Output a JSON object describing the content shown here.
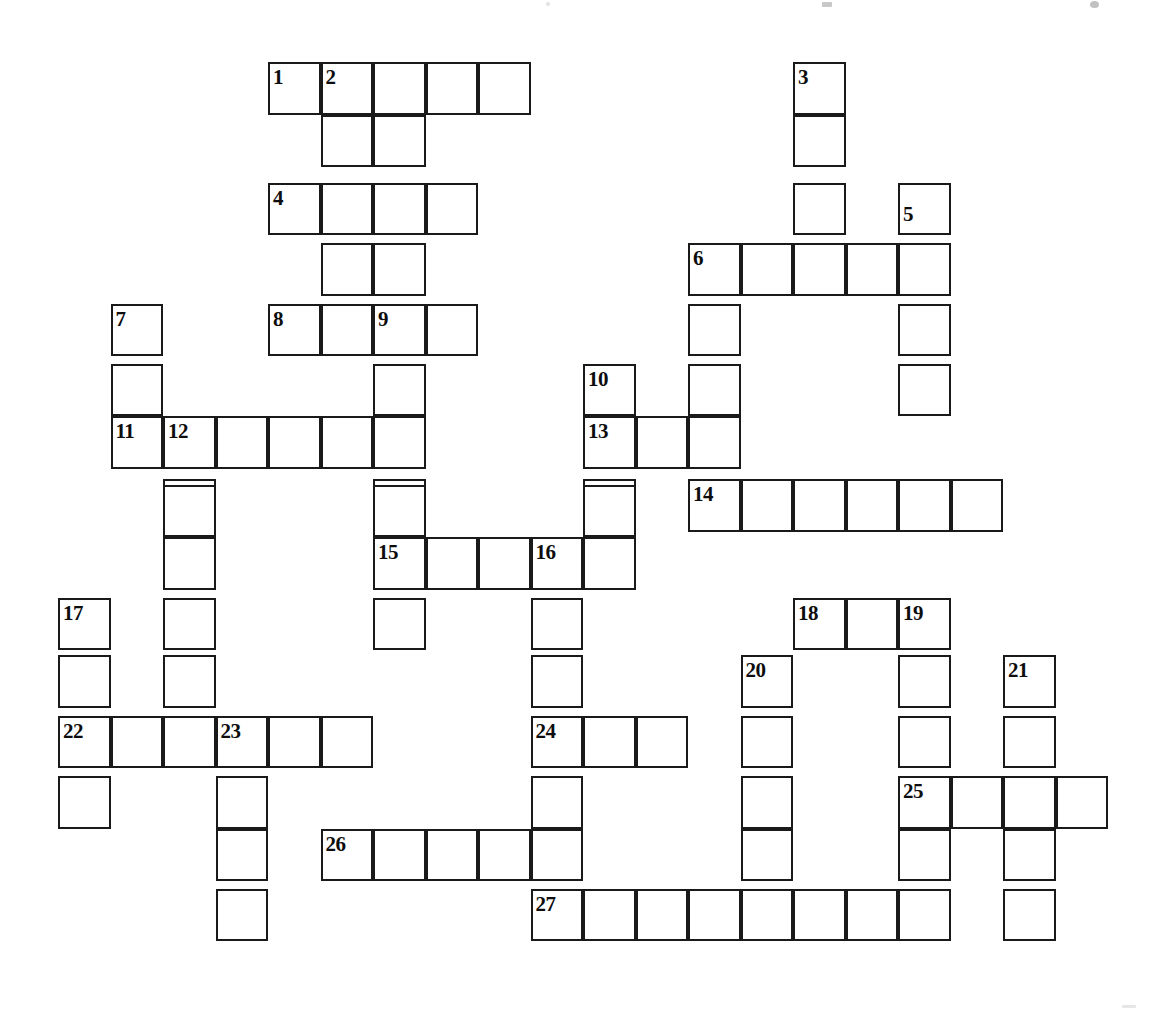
{
  "puzzle": {
    "title": "Crossword Puzzle Grid",
    "kind": "blank-crossword-grid",
    "canvas": {
      "width": 1166,
      "height": 1022,
      "background": "#ffffff"
    },
    "geometry": {
      "cell_size": 52.5,
      "origin_x": 58,
      "origin_y": 62,
      "line_color": "#1a1a1a",
      "line_width": 2.5,
      "number_font_size": 21
    },
    "counts": {
      "numbered_clues": 27,
      "total_cells": 131
    },
    "numbers": [
      {
        "n": "1",
        "col": 4,
        "row": 0
      },
      {
        "n": "2",
        "col": 5,
        "row": 0
      },
      {
        "n": "3",
        "col": 14,
        "row": 0
      },
      {
        "n": "4",
        "col": 4,
        "row": 2.3
      },
      {
        "n": "5",
        "col": 16,
        "row": 2.6
      },
      {
        "n": "6",
        "col": 12,
        "row": 3.45
      },
      {
        "n": "7",
        "col": 1,
        "row": 4.6
      },
      {
        "n": "8",
        "col": 4,
        "row": 4.6
      },
      {
        "n": "9",
        "col": 6,
        "row": 4.6
      },
      {
        "n": "10",
        "col": 10,
        "row": 5.75
      },
      {
        "n": "11",
        "col": 1,
        "row": 6.75
      },
      {
        "n": "12",
        "col": 2,
        "row": 6.75
      },
      {
        "n": "13",
        "col": 10,
        "row": 6.75
      },
      {
        "n": "14",
        "col": 12,
        "row": 7.95
      },
      {
        "n": "15",
        "col": 6,
        "row": 9.05
      },
      {
        "n": "16",
        "col": 9,
        "row": 9.05
      },
      {
        "n": "17",
        "col": 0,
        "row": 10.2
      },
      {
        "n": "18",
        "col": 14,
        "row": 10.2
      },
      {
        "n": "19",
        "col": 16,
        "row": 10.2
      },
      {
        "n": "20",
        "col": 13,
        "row": 11.3
      },
      {
        "n": "21",
        "col": 18,
        "row": 11.3
      },
      {
        "n": "22",
        "col": 0,
        "row": 12.45
      },
      {
        "n": "23",
        "col": 3,
        "row": 12.45
      },
      {
        "n": "24",
        "col": 9,
        "row": 12.45
      },
      {
        "n": "25",
        "col": 16,
        "row": 13.6
      },
      {
        "n": "26",
        "col": 5,
        "row": 14.6
      },
      {
        "n": "27",
        "col": 9,
        "row": 15.75
      }
    ],
    "entries": {
      "across": [
        {
          "number": "1",
          "col": 4,
          "row": 0,
          "length": 5
        },
        {
          "number": "4",
          "col": 4,
          "row": 2.3,
          "length": 4
        },
        {
          "number": "6",
          "col": 12,
          "row": 3.45,
          "length": 5
        },
        {
          "number": "8",
          "col": 4,
          "row": 4.6,
          "length": 4
        },
        {
          "number": "11",
          "col": 1,
          "row": 6.75,
          "length": 6
        },
        {
          "number": "13",
          "col": 10,
          "row": 6.75,
          "length": 3
        },
        {
          "number": "14",
          "col": 12,
          "row": 7.95,
          "length": 6
        },
        {
          "number": "15",
          "col": 6,
          "row": 9.05,
          "length": 5
        },
        {
          "number": "22",
          "col": 0,
          "row": 12.45,
          "length": 6
        },
        {
          "number": "24",
          "col": 9,
          "row": 12.45,
          "length": 3
        },
        {
          "number": "25",
          "col": 16,
          "row": 13.6,
          "length": 4
        },
        {
          "number": "26",
          "col": 5,
          "row": 14.6,
          "length": 5
        },
        {
          "number": "27",
          "col": 9,
          "row": 15.75,
          "length": 8
        }
      ],
      "down": [
        {
          "number": "2",
          "col": 5,
          "row": 0,
          "length": 4
        },
        {
          "number": "3",
          "col": 14,
          "row": 0,
          "length": 4
        },
        {
          "number": "5",
          "col": 16,
          "row": 2.6,
          "length": 4
        },
        {
          "number": "7",
          "col": 1,
          "row": 4.6,
          "length": 3
        },
        {
          "number": "9",
          "col": 6,
          "row": 4.6,
          "length": 6
        },
        {
          "number": "10",
          "col": 10,
          "row": 5.75,
          "length": 4
        },
        {
          "number": "12",
          "col": 2,
          "row": 6.75,
          "length": 9
        },
        {
          "number": "16",
          "col": 9,
          "row": 9.05,
          "length": 7
        },
        {
          "number": "17",
          "col": 0,
          "row": 10.2,
          "length": 4
        },
        {
          "number": "18",
          "col": 14,
          "row": 10.2,
          "length": 6
        },
        {
          "number": "19",
          "col": 16,
          "row": 10.2,
          "length": 6
        },
        {
          "number": "20",
          "col": 13,
          "row": 11.3,
          "length": 5
        },
        {
          "number": "21",
          "col": 18,
          "row": 11.3,
          "length": 5
        },
        {
          "number": "23",
          "col": 3,
          "row": 12.45,
          "length": 5
        }
      ]
    },
    "cells": [
      [
        4,
        0
      ],
      [
        5,
        0
      ],
      [
        6,
        0
      ],
      [
        7,
        0
      ],
      [
        8,
        0
      ],
      [
        5,
        1
      ],
      [
        6,
        1
      ],
      [
        4,
        2
      ],
      [
        5,
        2
      ],
      [
        6,
        2
      ],
      [
        7,
        2
      ],
      [
        14,
        0
      ],
      [
        14,
        1
      ],
      [
        14,
        2
      ],
      [
        16,
        2
      ],
      [
        12,
        3
      ],
      [
        13,
        3
      ],
      [
        14,
        3
      ],
      [
        15,
        3
      ],
      [
        16,
        3
      ],
      [
        5,
        3
      ],
      [
        6,
        3
      ],
      [
        12,
        4
      ],
      [
        16,
        4
      ],
      [
        1,
        4
      ],
      [
        4,
        4
      ],
      [
        5,
        4
      ],
      [
        6,
        4
      ],
      [
        7,
        4
      ],
      [
        16,
        5
      ],
      [
        12,
        5
      ],
      [
        1,
        5
      ],
      [
        6,
        5
      ],
      [
        10,
        5
      ],
      [
        1,
        6
      ],
      [
        2,
        6
      ],
      [
        3,
        6
      ],
      [
        4,
        6
      ],
      [
        5,
        6
      ],
      [
        6,
        6
      ],
      [
        10,
        6
      ],
      [
        11,
        6
      ],
      [
        12,
        6
      ],
      [
        2,
        7
      ],
      [
        6,
        7
      ],
      [
        10,
        7
      ],
      [
        12,
        7
      ],
      [
        13,
        7
      ],
      [
        14,
        7
      ],
      [
        15,
        7
      ],
      [
        16,
        7
      ],
      [
        17,
        7
      ],
      [
        2,
        8
      ],
      [
        6,
        8
      ],
      [
        10,
        8
      ],
      [
        6,
        9
      ],
      [
        7,
        9
      ],
      [
        8,
        9
      ],
      [
        9,
        9
      ],
      [
        10,
        9
      ],
      [
        2,
        9
      ],
      [
        2,
        10
      ],
      [
        6,
        10
      ],
      [
        9,
        10
      ],
      [
        0,
        10
      ],
      [
        14,
        10
      ],
      [
        15,
        10
      ],
      [
        16,
        10
      ],
      [
        0,
        11
      ],
      [
        2,
        11
      ],
      [
        9,
        11
      ],
      [
        13,
        11
      ],
      [
        16,
        11
      ],
      [
        18,
        11
      ],
      [
        13,
        12
      ],
      [
        16,
        12
      ],
      [
        18,
        12
      ],
      [
        0,
        12
      ],
      [
        1,
        12
      ],
      [
        2,
        12
      ],
      [
        3,
        12
      ],
      [
        4,
        12
      ],
      [
        5,
        12
      ],
      [
        9,
        12
      ],
      [
        10,
        12
      ],
      [
        11,
        12
      ],
      [
        0,
        13
      ],
      [
        3,
        13
      ],
      [
        9,
        13
      ],
      [
        13,
        13
      ],
      [
        16,
        13
      ],
      [
        17,
        13
      ],
      [
        18,
        13
      ],
      [
        19,
        13
      ],
      [
        3,
        14
      ],
      [
        9,
        14
      ],
      [
        13,
        14
      ],
      [
        16,
        14
      ],
      [
        18,
        14
      ],
      [
        5,
        14
      ],
      [
        6,
        14
      ],
      [
        7,
        14
      ],
      [
        8,
        14
      ],
      [
        3,
        15
      ],
      [
        9,
        15
      ],
      [
        10,
        15
      ],
      [
        11,
        15
      ],
      [
        12,
        15
      ],
      [
        13,
        15
      ],
      [
        14,
        15
      ],
      [
        15,
        15
      ],
      [
        16,
        15
      ],
      [
        18,
        15
      ]
    ]
  }
}
